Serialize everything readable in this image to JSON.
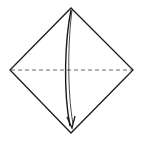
{
  "diagram": {
    "type": "origami-fold-step",
    "paper": {
      "shape": "square-diamond",
      "vertices": {
        "top": [
          71,
          8
        ],
        "right": [
          133,
          70
        ],
        "bottom": [
          71,
          133
        ],
        "left": [
          10,
          70
        ]
      },
      "stroke": "#1a1a1a",
      "fill": "#ffffff"
    },
    "fold_line": {
      "kind": "valley-fold",
      "style": "dashed",
      "from": [
        10,
        70
      ],
      "to": [
        133,
        70
      ],
      "color": "#555555"
    },
    "arrow": {
      "kind": "fold-direction",
      "direction": "top-to-bottom",
      "from": [
        71,
        10
      ],
      "to": [
        72,
        128
      ],
      "color": "#1a1a1a"
    }
  }
}
